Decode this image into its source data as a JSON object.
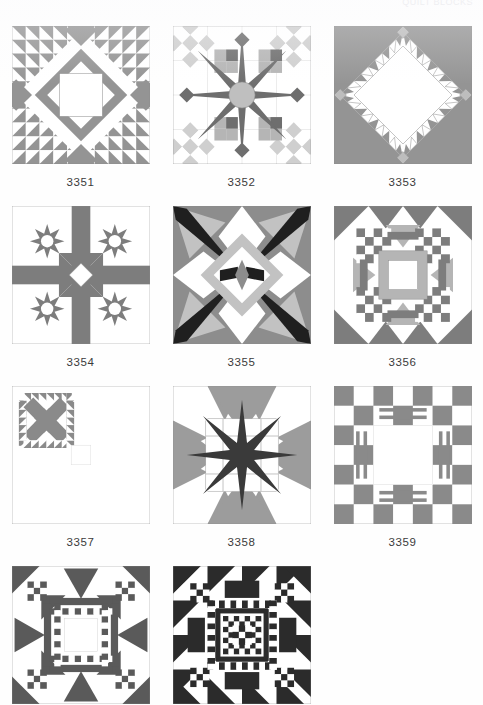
{
  "page": {
    "running_head": "QUILT BLOCKS",
    "background": "#fefefe",
    "width": 483,
    "height": 705
  },
  "palette": {
    "white": "#ffffff",
    "light_gray": "#bfbfbf",
    "mid_gray": "#949494",
    "dark_gray": "#6e6e6e",
    "black": "#2b2b2b",
    "outline": "#8a8a8a",
    "caption_color": "#3b3b3b"
  },
  "rows": [
    {
      "cells": [
        {
          "id": "3351",
          "caption": "3351",
          "pattern": "diamond-sashing-sawtooth",
          "show_caption": true,
          "colors": {
            "bg": "#ffffff",
            "main": "#949494",
            "accent": "#949494",
            "center": "#ffffff"
          }
        },
        {
          "id": "3352",
          "caption": "3352",
          "pattern": "compass-star",
          "show_caption": true,
          "colors": {
            "bg": "#ffffff",
            "main": "#6e6e6e",
            "accent": "#bfbfbf",
            "center": "#bfbfbf"
          }
        },
        {
          "id": "3353",
          "caption": "3353",
          "pattern": "sawtooth-diamond",
          "show_caption": true,
          "colors": {
            "bg": "#949494",
            "main": "#949494",
            "accent": "#ffffff",
            "center": "#ffffff"
          }
        }
      ]
    },
    {
      "cells": [
        {
          "id": "3354",
          "caption": "3354",
          "pattern": "four-stars-cross",
          "show_caption": true,
          "colors": {
            "bg": "#ffffff",
            "main": "#7d7d7d",
            "accent": "#7d7d7d",
            "center": "#ffffff"
          }
        },
        {
          "id": "3355",
          "caption": "3355",
          "pattern": "kaleidoscope",
          "show_caption": true,
          "colors": {
            "bg": "#ffffff",
            "main": "#8d8d8d",
            "accent": "#bfbfbf",
            "center": "#2b2b2b"
          }
        },
        {
          "id": "3356",
          "caption": "3356",
          "pattern": "checker-medallion-gray",
          "show_caption": true,
          "colors": {
            "bg": "#ffffff",
            "main": "#7d7d7d",
            "accent": "#b5b5b5",
            "center": "#ffffff"
          }
        }
      ]
    },
    {
      "cells": [
        {
          "id": "3357",
          "caption": "3357",
          "pattern": "four-patch-sawtooth-bars",
          "show_caption": true,
          "colors": {
            "bg": "#ffffff",
            "main": "#8a8a8a",
            "accent": "#8a8a8a",
            "center": "#ffffff"
          }
        },
        {
          "id": "3358",
          "caption": "3358",
          "pattern": "dark-star-pinwheel",
          "show_caption": true,
          "colors": {
            "bg": "#ffffff",
            "main": "#9c9c9c",
            "accent": "#3a3a3a",
            "center": "#3a3a3a"
          }
        },
        {
          "id": "3359",
          "caption": "3359",
          "pattern": "checkerboard-bars",
          "show_caption": true,
          "colors": {
            "bg": "#ffffff",
            "main": "#8a8a8a",
            "accent": "#8a8a8a",
            "center": "#ffffff"
          }
        }
      ]
    },
    {
      "cells": [
        {
          "id": "3360",
          "caption": "",
          "pattern": "checker-medallion-dark",
          "show_caption": false,
          "colors": {
            "bg": "#ffffff",
            "main": "#5a5a5a",
            "accent": "#5a5a5a",
            "center": "#ffffff"
          }
        },
        {
          "id": "3361",
          "caption": "",
          "pattern": "dense-checker-medallion",
          "show_caption": false,
          "colors": {
            "bg": "#ffffff",
            "main": "#2b2b2b",
            "accent": "#2b2b2b",
            "center": "#ffffff"
          }
        }
      ]
    }
  ]
}
